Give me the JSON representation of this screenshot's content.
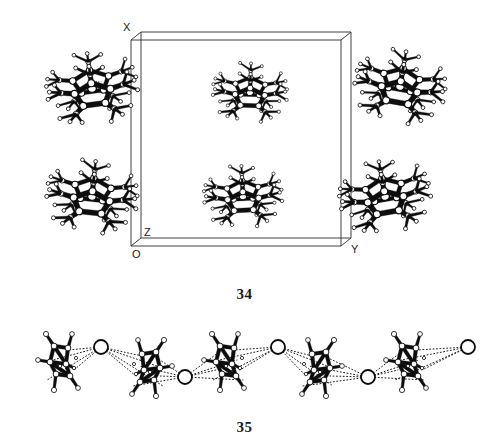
{
  "document": {
    "type": "scientific-figure-page",
    "background_color": "#ffffff",
    "ink_color": "#111111"
  },
  "figures": [
    {
      "id": "fig34",
      "caption": "34",
      "kind": "crystal-packing-diagram",
      "description": "Unit cell packing diagram of a decamethylmetallocene-type cluster structure viewed down a crystallographic axis, with six molecules drawn as ball-and-stick models inside and around an outlined unit cell box.",
      "axis_labels": [
        {
          "name": "X",
          "text": "X",
          "x": 123,
          "y": 31
        },
        {
          "name": "Y",
          "text": "Y",
          "x": 351,
          "y": 253
        },
        {
          "name": "Z",
          "text": "Z",
          "x": 144,
          "y": 236
        },
        {
          "name": "O",
          "text": "O",
          "x": 132,
          "y": 258
        }
      ],
      "unit_cell": {
        "front_face": [
          [
            131,
            40
          ],
          [
            341,
            40
          ],
          [
            341,
            246
          ],
          [
            131,
            246
          ]
        ],
        "back_face": [
          [
            141,
            32
          ],
          [
            351,
            32
          ],
          [
            351,
            238
          ],
          [
            141,
            238
          ]
        ],
        "stroke": "#2b2b2b",
        "stroke_width": 0.9
      },
      "molecules": [
        {
          "name": "cluster-top-left",
          "cx": 92,
          "cy": 88,
          "scale": 1.0,
          "rotation": -8,
          "style": "open"
        },
        {
          "name": "cluster-top-center",
          "cx": 250,
          "cy": 92,
          "scale": 0.82,
          "rotation": 2,
          "style": "open"
        },
        {
          "name": "cluster-top-right",
          "cx": 400,
          "cy": 86,
          "scale": 1.0,
          "rotation": 10,
          "style": "open"
        },
        {
          "name": "cluster-bottom-left",
          "cx": 92,
          "cy": 196,
          "scale": 1.0,
          "rotation": 6,
          "style": "open"
        },
        {
          "name": "cluster-bottom-center",
          "cx": 243,
          "cy": 196,
          "scale": 0.86,
          "rotation": -3,
          "style": "open"
        },
        {
          "name": "cluster-bottom-right",
          "cx": 385,
          "cy": 196,
          "scale": 1.0,
          "rotation": -10,
          "style": "open"
        }
      ]
    },
    {
      "id": "fig35",
      "caption": "35",
      "kind": "polymeric-chain-diagram",
      "description": "A one dimensional polymeric chain: organometallic cage fragments alternating with large open circles representing cations, linked by dotted contact lines.",
      "chain": {
        "cage_units": [
          {
            "name": "cage-1",
            "cx": 62,
            "cy": 364,
            "flip": 0
          },
          {
            "name": "cage-2",
            "cx": 148,
            "cy": 370,
            "flip": 1
          },
          {
            "name": "cage-3",
            "cx": 228,
            "cy": 364,
            "flip": 0
          },
          {
            "name": "cage-4",
            "cx": 318,
            "cy": 370,
            "flip": 1
          },
          {
            "name": "cage-5",
            "cx": 410,
            "cy": 364,
            "flip": 0
          }
        ],
        "cation_circles": [
          {
            "name": "cation-1",
            "cx": 101,
            "cy": 347,
            "r": 7
          },
          {
            "name": "cation-2",
            "cx": 185,
            "cy": 377,
            "r": 7
          },
          {
            "name": "cation-3",
            "cx": 278,
            "cy": 347,
            "r": 7
          },
          {
            "name": "cation-4",
            "cx": 368,
            "cy": 377,
            "r": 7
          },
          {
            "name": "cation-5",
            "cx": 468,
            "cy": 347,
            "r": 7
          }
        ],
        "contact_line_style": "dotted",
        "contact_stroke": "#222222"
      }
    }
  ],
  "atoms": {
    "legend_note": "Open circles = atoms drawn as spheres with white fill and black outline; bonds drawn as tapered black rods.",
    "sphere_fill": "#ffffff",
    "sphere_stroke": "#0d0d0d",
    "bond_fill": "#0d0d0d"
  }
}
